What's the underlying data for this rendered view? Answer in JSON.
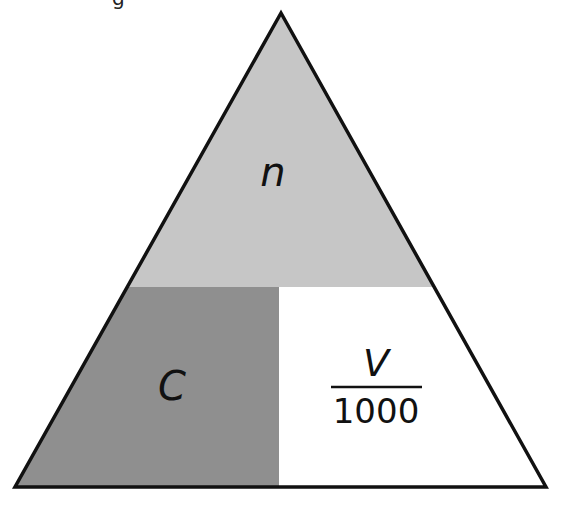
{
  "partial_caption_fragment": "g",
  "triangle": {
    "apex": [
      281,
      13
    ],
    "bottom_left": [
      15,
      487
    ],
    "bottom_right": [
      546,
      487
    ],
    "outline_color": "#111111",
    "outline_width": 3.5
  },
  "regions": {
    "top": {
      "label": "n",
      "fill": "#c6c6c6"
    },
    "bottom_left": {
      "label": "C",
      "fill": "#8f8f8f"
    },
    "bottom_right": {
      "numerator": "V",
      "denominator": "1000",
      "fill": "#ffffff"
    }
  },
  "dividers": {
    "horizontal_y": 287,
    "vertical_x": 279
  }
}
